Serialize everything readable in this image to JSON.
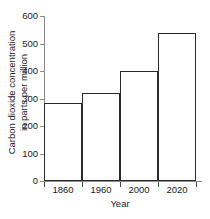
{
  "chart_data": {
    "type": "bar",
    "title": "",
    "categories": [
      "1860",
      "1960",
      "2000",
      "2020"
    ],
    "values": [
      285,
      320,
      400,
      540
    ],
    "xlabel": "Year",
    "ylabel": "Carbon dioxide concentration in parts per million",
    "ylabel_line1": "Carbon dioxide concentration",
    "ylabel_line2": "in parts per million",
    "ylim": [
      0,
      600
    ],
    "y_ticks": [
      "0",
      "100",
      "200",
      "300",
      "400",
      "500",
      "600"
    ],
    "y_tick_values": [
      0,
      100,
      200,
      300,
      400,
      500,
      600
    ],
    "grid": false,
    "legend": false,
    "bar_fill_color": "#ffffff",
    "bar_edge_color": "#2b2b2b",
    "axis_color": "#8c8c8c",
    "text_color": "#1a1a1a",
    "background_color": "#ffffff"
  }
}
